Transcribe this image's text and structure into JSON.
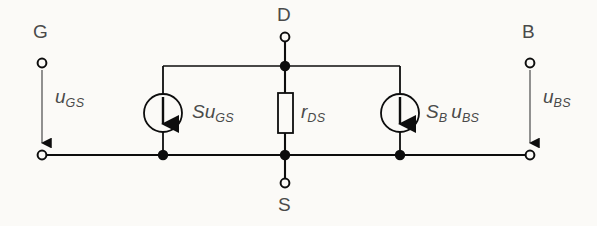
{
  "diagram": {
    "background_color": "#fbfaf7",
    "line_color": "#0d0d0d",
    "text_color": "#4a4a4a",
    "terminals": [
      {
        "name": "gate-terminal",
        "label": "G",
        "x": 42,
        "y": 63
      },
      {
        "name": "drain-terminal",
        "label": "D",
        "x": 285,
        "y": 37
      },
      {
        "name": "bulk-terminal",
        "label": "B",
        "x": 530,
        "y": 63
      },
      {
        "name": "source-terminal",
        "label": "S",
        "x": 285,
        "y": 183
      }
    ],
    "voltage_arrows": [
      {
        "name": "u-gs-arrow",
        "symbol": "u",
        "subscript": "GS",
        "x": 42,
        "y_from": 70,
        "y_to": 152
      },
      {
        "name": "u-bs-arrow",
        "symbol": "u",
        "subscript": "BS",
        "x": 530,
        "y_from": 70,
        "y_to": 152
      }
    ],
    "current_sources": [
      {
        "name": "current-source-su-gs",
        "prefix": "S",
        "prefix_sub": "",
        "symbol": "u",
        "subscript": "GS",
        "cx": 163,
        "cy": 113,
        "r": 19
      },
      {
        "name": "current-source-sb-ubs",
        "prefix": "S",
        "prefix_sub": "B",
        "symbol": "u",
        "subscript": "BS",
        "cx": 400,
        "cy": 113,
        "r": 19
      }
    ],
    "resistor": {
      "name": "resistor-rds",
      "symbol": "r",
      "subscript": "DS",
      "x": 278,
      "y": 93,
      "width": 15,
      "height": 40
    },
    "nodes": [
      {
        "name": "node-drain",
        "x": 285,
        "y": 66
      },
      {
        "name": "node-source-a",
        "x": 163,
        "y": 155
      },
      {
        "name": "node-source-b",
        "x": 285,
        "y": 155
      },
      {
        "name": "node-source-c",
        "x": 400,
        "y": 155
      }
    ],
    "labels": {
      "u_gs": {
        "symbol": "u",
        "subscript": "GS"
      },
      "u_bs": {
        "symbol": "u",
        "subscript": "BS"
      },
      "su_gs": {
        "prefix": "S",
        "symbol": "u",
        "subscript": "GS"
      },
      "sb_ubs": {
        "prefix": "S",
        "prefix_subscript": "B",
        "symbol": "u",
        "subscript": "BS"
      },
      "r_ds": {
        "symbol": "r",
        "subscript": "DS"
      },
      "g": "G",
      "d": "D",
      "s": "S",
      "b": "B"
    }
  }
}
